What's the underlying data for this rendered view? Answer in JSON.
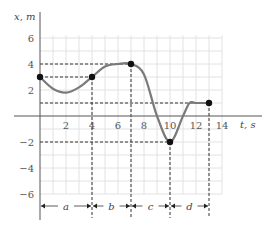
{
  "chart_data": {
    "type": "line",
    "title": "",
    "xlabel": "t, s",
    "ylabel": "x, m",
    "xlim": [
      0,
      14
    ],
    "ylim": [
      -7,
      7
    ],
    "grid": true,
    "x_ticks": [
      "2",
      "4",
      "6",
      "8",
      "10",
      "12",
      "14"
    ],
    "y_ticks": [
      "6",
      "4",
      "2",
      "−2",
      "−4",
      "−6"
    ],
    "key_points": [
      {
        "t": 0,
        "x": 3
      },
      {
        "t": 4,
        "x": 3
      },
      {
        "t": 7,
        "x": 4
      },
      {
        "t": 10,
        "x": -2
      },
      {
        "t": 13,
        "x": 1
      }
    ],
    "curve": {
      "t": [
        0,
        1,
        2,
        3,
        4,
        5,
        6,
        7,
        8,
        9,
        10,
        11,
        11.5,
        12,
        13
      ],
      "x": [
        3,
        2.1,
        1.8,
        2.2,
        3,
        3.8,
        4,
        4,
        3.2,
        0,
        -2,
        0,
        1,
        1,
        1
      ]
    },
    "interval_labels": [
      {
        "label": "a",
        "from": 0,
        "to": 4
      },
      {
        "label": "b",
        "from": 4,
        "to": 7
      },
      {
        "label": "c",
        "from": 7,
        "to": 10
      },
      {
        "label": "d",
        "from": 10,
        "to": 13
      }
    ],
    "dashed_guides": {
      "horizontal_x_values": [
        4,
        3,
        1,
        -2
      ],
      "vertical_t_values": [
        4,
        7,
        10,
        13
      ]
    }
  },
  "axes": {
    "x_label": "t, s",
    "y_label": "x, m"
  },
  "intervals": {
    "a": "a",
    "b": "b",
    "c": "c",
    "d": "d"
  },
  "colors": {
    "curve": "#7a7a7a",
    "point": "#111111",
    "grid": "#e2e2e2",
    "axis": "#555555",
    "dash": "#333333"
  }
}
